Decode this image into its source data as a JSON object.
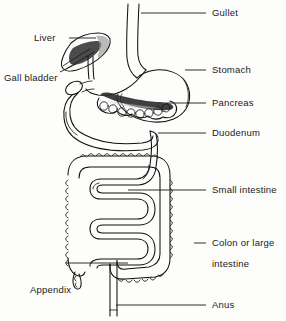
{
  "figure": {
    "style": "hand-drawn black and white line diagram",
    "background_color": "#fdfdfb",
    "ink_color": "#111111"
  },
  "labels": [
    {
      "id": "gullet",
      "text": "Gullet",
      "x": 212,
      "y": 8,
      "leader": {
        "x1": 141,
        "y1": 13,
        "x2": 206,
        "y2": 13
      }
    },
    {
      "id": "liver",
      "text": "Liver",
      "x": 34,
      "y": 33,
      "leader": {
        "x1": 69,
        "y1": 38,
        "x2": 96,
        "y2": 38
      }
    },
    {
      "id": "stomach",
      "text": "Stomach",
      "x": 212,
      "y": 65,
      "leader": {
        "x1": 185,
        "y1": 70,
        "x2": 206,
        "y2": 70
      }
    },
    {
      "id": "gall-bladder",
      "text": "Gall bladder",
      "x": 4,
      "y": 73,
      "leader": {
        "x1": 60,
        "y1": 72,
        "x2": 76,
        "y2": 64
      }
    },
    {
      "id": "pancreas",
      "text": "Pancreas",
      "x": 212,
      "y": 98,
      "leader": {
        "x1": 166,
        "y1": 103,
        "x2": 206,
        "y2": 103
      }
    },
    {
      "id": "duodenum",
      "text": "Duodenum",
      "x": 212,
      "y": 128,
      "leader": {
        "x1": 158,
        "y1": 133,
        "x2": 206,
        "y2": 133
      }
    },
    {
      "id": "small-intestine",
      "text": "Small intestine",
      "x": 212,
      "y": 185,
      "leader": {
        "x1": 128,
        "y1": 190,
        "x2": 206,
        "y2": 190
      }
    },
    {
      "id": "colon-line-1",
      "text": "Colon or large",
      "x": 212,
      "y": 238,
      "leader": {
        "x1": 194,
        "y1": 243,
        "x2": 206,
        "y2": 243
      }
    },
    {
      "id": "colon-line-2",
      "text": "intestine",
      "x": 212,
      "y": 259,
      "leader": null
    },
    {
      "id": "appendix",
      "text": "Appendix",
      "x": 30,
      "y": 285,
      "leader": {
        "x1": 66,
        "y1": 263,
        "x2": 128,
        "y2": 263
      }
    },
    {
      "id": "anus",
      "text": "Anus",
      "x": 212,
      "y": 300,
      "leader": {
        "x1": 116,
        "y1": 305,
        "x2": 206,
        "y2": 305
      }
    }
  ],
  "organs": [
    {
      "id": "gullet",
      "common_name": "Gullet",
      "anatomical_name": "Oesophagus"
    },
    {
      "id": "liver",
      "common_name": "Liver",
      "anatomical_name": "Liver"
    },
    {
      "id": "gall-bladder",
      "common_name": "Gall bladder",
      "anatomical_name": "Gall bladder"
    },
    {
      "id": "stomach",
      "common_name": "Stomach",
      "anatomical_name": "Stomach"
    },
    {
      "id": "pancreas",
      "common_name": "Pancreas",
      "anatomical_name": "Pancreas"
    },
    {
      "id": "duodenum",
      "common_name": "Duodenum",
      "anatomical_name": "Duodenum"
    },
    {
      "id": "small-intestine",
      "common_name": "Small intestine",
      "anatomical_name": "Small intestine"
    },
    {
      "id": "colon",
      "common_name": "Colon or large intestine",
      "anatomical_name": "Large intestine"
    },
    {
      "id": "appendix",
      "common_name": "Appendix",
      "anatomical_name": "Vermiform appendix"
    },
    {
      "id": "anus",
      "common_name": "Anus",
      "anatomical_name": "Anus"
    }
  ]
}
